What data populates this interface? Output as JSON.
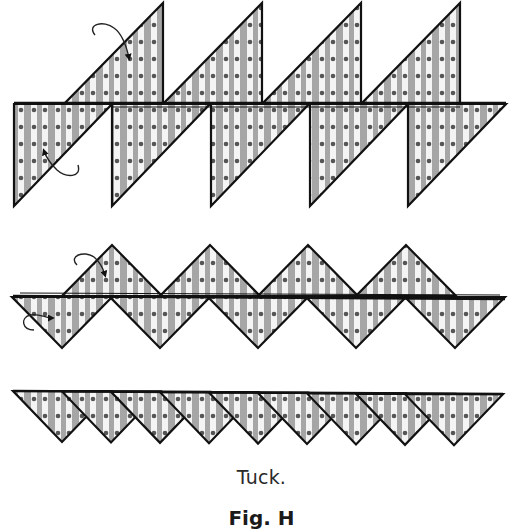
{
  "figure": {
    "caption": "Tuck.",
    "label": "Fig. H",
    "colors": {
      "fabric_light": "#f4f4f4",
      "fabric_stripe": "#a6a6a6",
      "dot": "#555555",
      "outline": "#111111",
      "arrow": "#222222"
    },
    "rows": [
      {
        "name": "row-top-staggered",
        "description": "Two staggered rows of right-triangle units: upper units lean right, lower units hang below the seam",
        "upper_units": {
          "count": 4,
          "right_edge_x": [
            163,
            262,
            361,
            460
          ],
          "top_y": 3,
          "seam_y": 103,
          "width": 98
        },
        "lower_units": {
          "count": 5,
          "left_edge_x": [
            14,
            112,
            211,
            310,
            408
          ],
          "seam_y": 104,
          "width": 98,
          "height": 102
        },
        "arrows": [
          {
            "name": "fold-arrow-upper",
            "path": "M95,35 C86,24 104,20 114,28 C121,33 126,44 129,58",
            "head": [
              129,
              62
            ],
            "dir": "down"
          },
          {
            "name": "fold-arrow-lower",
            "path": "M78,165 C82,178 66,178 57,170 C51,164 46,157 44,151",
            "head": [
              42,
              147
            ],
            "dir": "up"
          }
        ]
      },
      {
        "name": "row-middle-zigzag",
        "description": "Interlocking zigzag of isosceles right triangles",
        "upper_units": {
          "count": 4,
          "apex_x": [
            112,
            210,
            308,
            406
          ],
          "apex_y": 245,
          "base_y": 296,
          "half_width": 50
        },
        "lower_units": {
          "count": 5,
          "apex_x": [
            62,
            160,
            258,
            356,
            455
          ],
          "apex_y": 348,
          "base_y": 297,
          "half_width": 50
        },
        "arrows": [
          {
            "name": "tuck-arrow-upper",
            "path": "M77,265 C68,256 84,250 94,257 C100,262 103,268 105,275",
            "head": [
              106,
              280
            ],
            "dir": "down"
          },
          {
            "name": "tuck-arrow-lower",
            "path": "M34,330 C22,330 20,318 30,315 C38,313 46,318 52,318",
            "head": [
              58,
              316
            ],
            "dir": "right"
          }
        ]
      },
      {
        "name": "row-bottom-tucked",
        "description": "Nine overlapping downward triangles after tucking",
        "units": {
          "count": 9,
          "apex_x": [
            62,
            111,
            160,
            209,
            258,
            307,
            356,
            405,
            454
          ],
          "apex_y": 442,
          "base_y": 391,
          "half_width": 49
        }
      }
    ]
  }
}
